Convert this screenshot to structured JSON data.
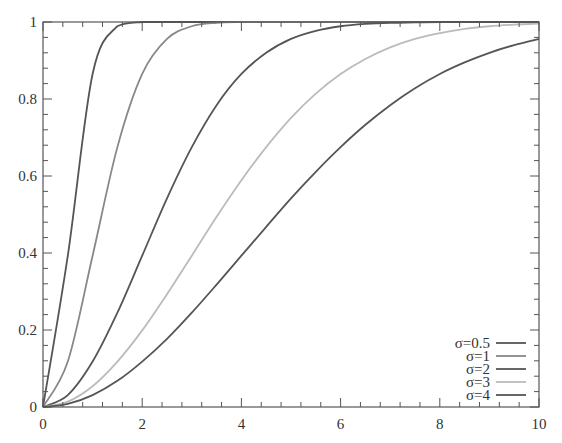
{
  "chart_data": {
    "type": "line",
    "title": "",
    "xlabel": "",
    "ylabel": "",
    "xlim": [
      0,
      10
    ],
    "ylim": [
      0,
      1
    ],
    "grid": false,
    "legend_position": "lower right",
    "x_ticks": [
      0,
      2,
      4,
      6,
      8,
      10
    ],
    "x_tick_labels": [
      "0",
      "2",
      "4",
      "6",
      "8",
      "10"
    ],
    "y_ticks": [
      0,
      0.2,
      0.4,
      0.6,
      0.8,
      1
    ],
    "y_tick_labels": [
      "0",
      "0.2",
      "0.4",
      "0.6",
      "0.8",
      "1"
    ],
    "x_minor_step": 0.4,
    "y_minor_step": 0.04,
    "x": [
      0,
      0.5,
      1,
      1.5,
      2,
      2.5,
      3,
      3.5,
      4,
      4.5,
      5,
      5.5,
      6,
      6.5,
      7,
      7.5,
      8,
      8.5,
      9,
      9.5,
      10
    ],
    "series": [
      {
        "name": "σ=0.5",
        "color": "#555555",
        "values": [
          0,
          0.393,
          0.865,
          0.989,
          1.0,
          1.0,
          1.0,
          1.0,
          1.0,
          1.0,
          1.0,
          1.0,
          1.0,
          1.0,
          1.0,
          1.0,
          1.0,
          1.0,
          1.0,
          1.0,
          1.0
        ]
      },
      {
        "name": "σ=1",
        "color": "#888888",
        "values": [
          0,
          0.118,
          0.393,
          0.675,
          0.865,
          0.956,
          0.989,
          0.998,
          1.0,
          1.0,
          1.0,
          1.0,
          1.0,
          1.0,
          1.0,
          1.0,
          1.0,
          1.0,
          1.0,
          1.0,
          1.0
        ]
      },
      {
        "name": "σ=2",
        "color": "#555555",
        "values": [
          0,
          0.031,
          0.118,
          0.245,
          0.393,
          0.542,
          0.675,
          0.784,
          0.865,
          0.92,
          0.956,
          0.977,
          0.989,
          0.995,
          0.998,
          0.999,
          1.0,
          1.0,
          1.0,
          1.0,
          1.0
        ]
      },
      {
        "name": "σ=3",
        "color": "#bbbbbb",
        "values": [
          0,
          0.014,
          0.054,
          0.118,
          0.199,
          0.293,
          0.393,
          0.494,
          0.589,
          0.675,
          0.751,
          0.814,
          0.865,
          0.904,
          0.934,
          0.956,
          0.971,
          0.982,
          0.989,
          0.993,
          0.996
        ]
      },
      {
        "name": "σ=4",
        "color": "#555555",
        "values": [
          0,
          0.008,
          0.031,
          0.068,
          0.118,
          0.177,
          0.245,
          0.318,
          0.393,
          0.468,
          0.542,
          0.611,
          0.675,
          0.733,
          0.784,
          0.828,
          0.865,
          0.895,
          0.92,
          0.94,
          0.956
        ]
      }
    ]
  },
  "legend": {
    "items": [
      {
        "label": "σ=0.5",
        "color": "#555555"
      },
      {
        "label": "σ=1",
        "color": "#888888"
      },
      {
        "label": "σ=2",
        "color": "#555555"
      },
      {
        "label": "σ=3",
        "color": "#bbbbbb"
      },
      {
        "label": "σ=4",
        "color": "#555555"
      }
    ]
  }
}
